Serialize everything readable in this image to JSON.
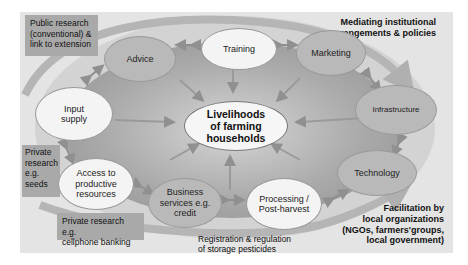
{
  "diagram": {
    "center": {
      "line1": "Livelihoods",
      "line2": "of farming",
      "line3": "households"
    },
    "nodes": [
      {
        "id": "advice",
        "label": "Advice",
        "shade": "dark"
      },
      {
        "id": "training",
        "label": "Training",
        "shade": "light"
      },
      {
        "id": "marketing",
        "label": "Marketing",
        "shade": "dark"
      },
      {
        "id": "infrastructure",
        "label": "Infrastructure",
        "shade": "dark"
      },
      {
        "id": "technology",
        "label": "Technology",
        "shade": "dark"
      },
      {
        "id": "processing",
        "line1": "Processing /",
        "line2": "Post-harvest",
        "shade": "light"
      },
      {
        "id": "business",
        "line1": "Business",
        "line2": "services e.g.",
        "line3": "credit",
        "shade": "dark"
      },
      {
        "id": "access",
        "line1": "Access to",
        "line2": "productive",
        "line3": "resources",
        "shade": "light"
      },
      {
        "id": "input",
        "line1": "Input",
        "line2": "supply",
        "shade": "light"
      }
    ],
    "boxes": {
      "public_research": {
        "line1": "Public research",
        "line2": "(conventional) &",
        "line3": "link to extension"
      },
      "private_seeds": {
        "line1": "Private",
        "line2": "research",
        "line3": "e.g.",
        "line4": "seeds"
      },
      "private_banking": {
        "line1": "Private research e.g.",
        "line2": "cellphone banking"
      }
    },
    "labels": {
      "mediating": {
        "line1": "Mediating institutional",
        "line2": "arrangements & policies"
      },
      "registration": {
        "line1": "Registration & regulation",
        "line2": "of storage pesticides"
      },
      "facilitation": {
        "line1": "Facilitation by",
        "line2": "local organizations",
        "line3": "(NGOs, farmers'groups,",
        "line4": "local government)"
      }
    },
    "colors": {
      "panel": "#e4e4e4",
      "ring": "#c9c9c9",
      "inner": "#a8a8a8",
      "dark_node": "#b9b9b9",
      "light_node": "#f4f4f4",
      "box": "#a9a9a9",
      "arrow": "#999999"
    }
  }
}
